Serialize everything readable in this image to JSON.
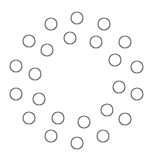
{
  "diagram": {
    "stroke_color": "#6e6e6e",
    "background": "#ffffff",
    "circle_radius": 6,
    "outer_ring": [
      {
        "x": 77,
        "y": 18
      },
      {
        "x": 104,
        "y": 24
      },
      {
        "x": 125,
        "y": 42
      },
      {
        "x": 137,
        "y": 67
      },
      {
        "x": 137,
        "y": 94
      },
      {
        "x": 125,
        "y": 119
      },
      {
        "x": 103,
        "y": 136
      },
      {
        "x": 77,
        "y": 143
      },
      {
        "x": 51,
        "y": 136
      },
      {
        "x": 29,
        "y": 118
      },
      {
        "x": 16,
        "y": 94
      },
      {
        "x": 16,
        "y": 66
      },
      {
        "x": 29,
        "y": 41
      },
      {
        "x": 51,
        "y": 24
      }
    ],
    "inner_ring": [
      {
        "x": 70,
        "y": 38
      },
      {
        "x": 96,
        "y": 42
      },
      {
        "x": 115,
        "y": 60
      },
      {
        "x": 119,
        "y": 87
      },
      {
        "x": 107,
        "y": 110
      },
      {
        "x": 84,
        "y": 122
      },
      {
        "x": 58,
        "y": 118
      },
      {
        "x": 39,
        "y": 99
      },
      {
        "x": 35,
        "y": 74
      },
      {
        "x": 47,
        "y": 50
      }
    ]
  }
}
